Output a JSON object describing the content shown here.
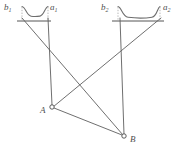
{
  "figure": {
    "background_color": "#ffffff",
    "line_color": "#6a6a6a",
    "label_color": "#4f4f4f",
    "marker_fill": "#ffffff",
    "width": 177,
    "height": 155
  },
  "labels": {
    "b1": "b",
    "b1_sub": "1",
    "a1": "a",
    "a1_sub": "1",
    "b2": "b",
    "b2_sub": "2",
    "a2": "a",
    "a2_sub": "2",
    "point_a": "A",
    "point_b": "B"
  },
  "geometry": {
    "baseline_left": {
      "x1": 17,
      "y1": 21,
      "x2": 51,
      "y2": 21
    },
    "baseline_right": {
      "x1": 112,
      "y1": 21,
      "x2": 164,
      "y2": 21
    },
    "curve_left": {
      "start_x": 22,
      "start_y": 6,
      "end_x": 48,
      "end_y": 6,
      "sag_y": 16
    },
    "curve_right": {
      "start_x": 118,
      "start_y": 6,
      "end_x": 160,
      "end_y": 6,
      "sag_y": 17
    },
    "tick_left_b": {
      "x": 22,
      "y1": 6,
      "y2": 21
    },
    "tick_left_a": {
      "x": 48,
      "y1": 6,
      "y2": 21
    },
    "tick_right_b": {
      "x": 118,
      "y1": 6,
      "y2": 21
    },
    "tick_right_a": {
      "x": 160,
      "y1": 6,
      "y2": 21
    },
    "point_a_node": {
      "x": 52,
      "y": 107,
      "r": 2.2
    },
    "point_b_node": {
      "x": 124,
      "y": 136,
      "r": 2.2
    },
    "sight_lines": [
      {
        "name": "left-a1-to-A",
        "x1": 48,
        "y1": 19,
        "x2": 52,
        "y2": 106
      },
      {
        "name": "left-b1-to-B",
        "x1": 22,
        "y1": 19,
        "x2": 123,
        "y2": 135
      },
      {
        "name": "right-b2-to-A",
        "x1": 120,
        "y1": 19,
        "x2": 124,
        "y2": 135
      },
      {
        "name": "right-a2-to-A",
        "x1": 161,
        "y1": 19,
        "x2": 53,
        "y2": 107
      },
      {
        "name": "A-to-B",
        "x1": 54,
        "y1": 108,
        "x2": 122,
        "y2": 135
      }
    ]
  }
}
